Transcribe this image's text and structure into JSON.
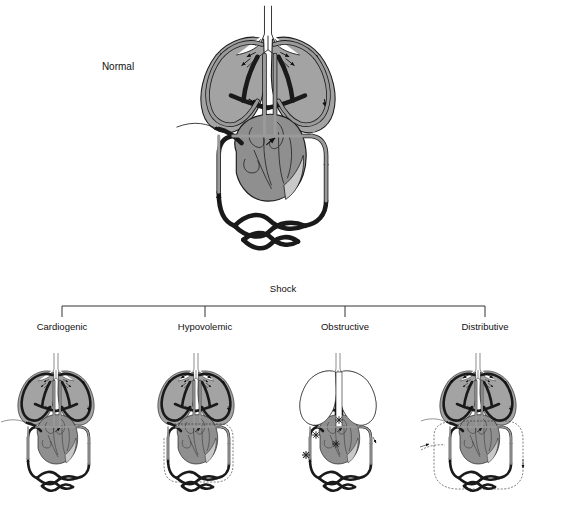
{
  "figure": {
    "title_normal": "Normal",
    "group_label": "Shock",
    "background_color": "#ffffff",
    "vessel_fill": "#9a9a9a",
    "vessel_stroke": "#1a1a1a",
    "heart_fill": "#8f8f8f",
    "lung_fill": "#a0a0a0",
    "lung_fill_empty": "#ffffff",
    "line_color": "#333333"
  },
  "normal_panel": {
    "label": "Normal",
    "label_x": 118,
    "label_y": 70,
    "lungs_filled": true,
    "systemic_dashed": false,
    "dilated_dashed": false,
    "blockages": 0,
    "arrows_visible": true,
    "pointer_line": true
  },
  "bracket": {
    "label": "Shock",
    "label_x": 283,
    "label_y": 292,
    "left_x": 62,
    "right_x": 485,
    "top_y": 306,
    "tick_bottom_y": 316,
    "ticks": [
      62,
      205,
      345,
      485
    ]
  },
  "shock_panels": [
    {
      "label": "Cardiogenic",
      "label_x": 62,
      "label_y": 330,
      "panel_x": 6,
      "lungs_filled": true,
      "systemic_dashed": false,
      "dilated_dashed": false,
      "blockages": 0,
      "heart_failing": true,
      "outflow_arrows": 0,
      "pointer_line": true
    },
    {
      "label": "Hypovolemic",
      "label_x": 205,
      "label_y": 330,
      "panel_x": 146,
      "lungs_filled": true,
      "systemic_dashed": true,
      "dilated_dashed": false,
      "blockages": 0,
      "heart_failing": false,
      "outflow_arrows": 2,
      "pointer_line": true
    },
    {
      "label": "Obstructive",
      "label_x": 345,
      "label_y": 330,
      "panel_x": 288,
      "lungs_filled": false,
      "systemic_dashed": false,
      "dilated_dashed": false,
      "blockages": 4,
      "heart_failing": false,
      "outflow_arrows": 1,
      "pointer_line": false
    },
    {
      "label": "Distributive",
      "label_x": 485,
      "label_y": 330,
      "panel_x": 428,
      "lungs_filled": true,
      "systemic_dashed": false,
      "dilated_dashed": true,
      "blockages": 0,
      "heart_failing": false,
      "outflow_arrows": 2,
      "pointer_line": true
    }
  ]
}
